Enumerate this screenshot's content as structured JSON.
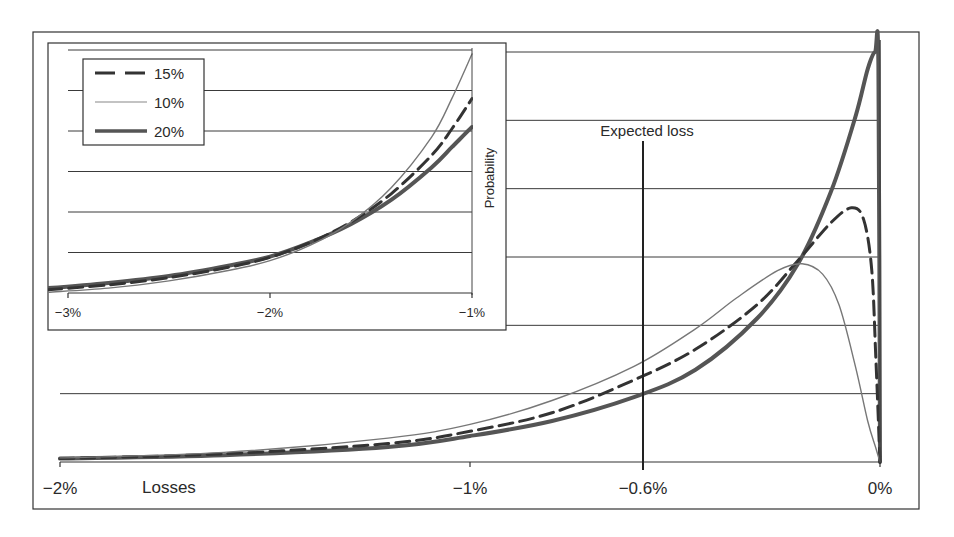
{
  "chart_data": [
    {
      "id": "main",
      "type": "line",
      "title": "",
      "xlabel": "Losses",
      "ylabel": "Probability",
      "xlim": [
        -2,
        0
      ],
      "x_ticks": [
        {
          "value": -2,
          "label": "−2%"
        },
        {
          "value": -1,
          "label": "−1%"
        },
        {
          "value": -0.6,
          "label": "−0.6%"
        },
        {
          "value": 0,
          "label": "0%"
        }
      ],
      "ylim": [
        0,
        6
      ],
      "grid": {
        "horizontal": true,
        "lines": 6
      },
      "annotations": [
        {
          "type": "vline",
          "x": -0.6,
          "label": "Expected loss"
        }
      ],
      "legend_position": "inset-top-left",
      "series": [
        {
          "name": "20%",
          "style": "thick-solid",
          "x": [
            -2,
            -1.6,
            -1.2,
            -1.0,
            -0.8,
            -0.6,
            -0.45,
            -0.3,
            -0.2,
            -0.12,
            -0.06,
            -0.03,
            -0.012,
            -0.004,
            0
          ],
          "y": [
            0.05,
            0.1,
            0.22,
            0.38,
            0.6,
            0.95,
            1.35,
            2.1,
            2.9,
            3.95,
            5.05,
            5.75,
            6.0,
            5.8,
            0
          ]
        },
        {
          "name": "15%",
          "style": "dashed",
          "x": [
            -2,
            -1.6,
            -1.2,
            -1.0,
            -0.8,
            -0.6,
            -0.45,
            -0.3,
            -0.2,
            -0.12,
            -0.07,
            -0.04,
            -0.02,
            -0.01,
            0
          ],
          "y": [
            0.05,
            0.12,
            0.27,
            0.45,
            0.72,
            1.2,
            1.65,
            2.3,
            2.95,
            3.5,
            3.72,
            3.55,
            2.8,
            1.5,
            0
          ]
        },
        {
          "name": "10%",
          "style": "thin-solid",
          "x": [
            -2,
            -1.6,
            -1.2,
            -1.0,
            -0.8,
            -0.6,
            -0.45,
            -0.35,
            -0.25,
            -0.19,
            -0.14,
            -0.1,
            -0.06,
            -0.03,
            -0.01,
            0
          ],
          "y": [
            0.06,
            0.14,
            0.35,
            0.55,
            0.9,
            1.4,
            1.95,
            2.4,
            2.8,
            2.9,
            2.75,
            2.3,
            1.4,
            0.6,
            0.2,
            0
          ]
        }
      ]
    },
    {
      "id": "inset",
      "type": "line",
      "title": "",
      "xlabel": "",
      "ylabel": "Probability",
      "xlim": [
        -3,
        -1
      ],
      "x_ticks": [
        {
          "value": -3,
          "label": "−3%"
        },
        {
          "value": -2,
          "label": "−2%"
        },
        {
          "value": -1,
          "label": "−1%"
        }
      ],
      "ylim": [
        0,
        6
      ],
      "grid": {
        "horizontal": true,
        "lines": 6
      },
      "series": [
        {
          "name": "20%",
          "style": "thick-solid",
          "x": [
            -3.1,
            -2.8,
            -2.5,
            -2.2,
            -2.0,
            -1.8,
            -1.6,
            -1.4,
            -1.2,
            -1.1,
            -1.0
          ],
          "y": [
            0.12,
            0.25,
            0.42,
            0.68,
            0.9,
            1.25,
            1.7,
            2.3,
            3.1,
            3.6,
            4.1
          ]
        },
        {
          "name": "15%",
          "style": "dashed",
          "x": [
            -3.1,
            -2.8,
            -2.5,
            -2.2,
            -2.0,
            -1.8,
            -1.6,
            -1.4,
            -1.2,
            -1.1,
            -1.0
          ],
          "y": [
            0.08,
            0.2,
            0.38,
            0.64,
            0.88,
            1.25,
            1.75,
            2.45,
            3.4,
            4.05,
            4.8
          ]
        },
        {
          "name": "10%",
          "style": "thin-solid",
          "x": [
            -3.1,
            -2.8,
            -2.5,
            -2.2,
            -2.0,
            -1.8,
            -1.6,
            -1.4,
            -1.2,
            -1.1,
            -1.0
          ],
          "y": [
            0.02,
            0.12,
            0.3,
            0.56,
            0.8,
            1.18,
            1.75,
            2.6,
            3.85,
            4.8,
            5.9
          ]
        }
      ],
      "legend": [
        {
          "name": "15%",
          "style": "dashed"
        },
        {
          "name": "10%",
          "style": "thin-solid"
        },
        {
          "name": "20%",
          "style": "thick-solid"
        }
      ]
    }
  ],
  "labels": {
    "expected_loss": "Expected loss",
    "losses": "Losses",
    "probability": "Probability",
    "main_ticks": [
      "−2%",
      "−1%",
      "−0.6%",
      "0%"
    ],
    "inset_ticks": [
      "−3%",
      "−2%",
      "−1%"
    ],
    "legend": [
      "15%",
      "10%",
      "20%"
    ]
  },
  "colors": {
    "ink": "#2a2a2a",
    "series_20": "#555555",
    "series_15": "#333333",
    "series_10": "#777777",
    "grid": "#3a3a3a"
  }
}
